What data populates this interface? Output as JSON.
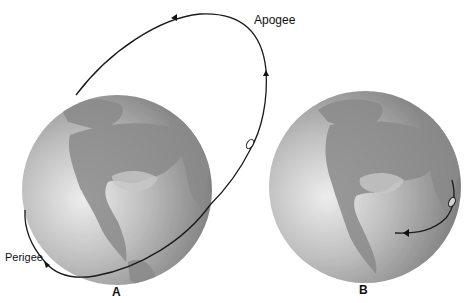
{
  "figure": {
    "panels": [
      {
        "id": "A",
        "label": "A",
        "description": "Highly elliptical orbit around Earth with apogee far above and perigee near the surface",
        "annotations": {
          "apogee": "Apogee",
          "perigee": "Perigee"
        }
      },
      {
        "id": "B",
        "label": "B",
        "description": "Same orbit viewed as ground track over Earth, short arc near the limb"
      }
    ],
    "colors": {
      "orbit_line": "#1a1a1a",
      "globe_light": "#e6e6e6",
      "globe_dark": "#7a7a7a",
      "land": "#8c8c8c",
      "background": "#ffffff"
    }
  }
}
